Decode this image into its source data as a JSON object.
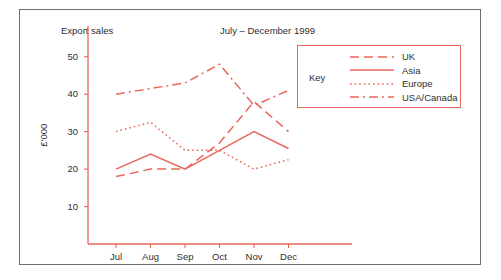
{
  "figure": {
    "title": "Export sales",
    "subtitle": "July – December 1999",
    "ylabel": "£'000",
    "legend_title": "Key",
    "accent_color": "#e9675a",
    "text_color": "#2e2e30",
    "border_color": "#6e6e70",
    "background": "#ffffff"
  },
  "chart_data": {
    "type": "line",
    "title": "Export sales",
    "subtitle": "July – December 1999",
    "xlabel": "",
    "ylabel": "£'000",
    "categories": [
      "Jul",
      "Aug",
      "Sep",
      "Oct",
      "Nov",
      "Dec"
    ],
    "ylim": [
      0,
      55
    ],
    "yticks": [
      10,
      20,
      30,
      40,
      50
    ],
    "grid": false,
    "legend_position": "top-right",
    "legend_title": "Key",
    "series": [
      {
        "name": "UK",
        "style": "dashed",
        "color": "#e9675a",
        "values": [
          18,
          20,
          20,
          27,
          38,
          30
        ]
      },
      {
        "name": "Asia",
        "style": "solid",
        "color": "#e9675a",
        "values": [
          20,
          24,
          20,
          25,
          30,
          25.5
        ]
      },
      {
        "name": "Europe",
        "style": "dotted",
        "color": "#e9675a",
        "values": [
          30,
          32.5,
          25,
          25,
          20,
          22.5
        ]
      },
      {
        "name": "USA/Canada",
        "style": "dash-dot",
        "color": "#e9675a",
        "values": [
          40,
          41.5,
          43,
          48,
          37,
          41
        ]
      }
    ]
  }
}
